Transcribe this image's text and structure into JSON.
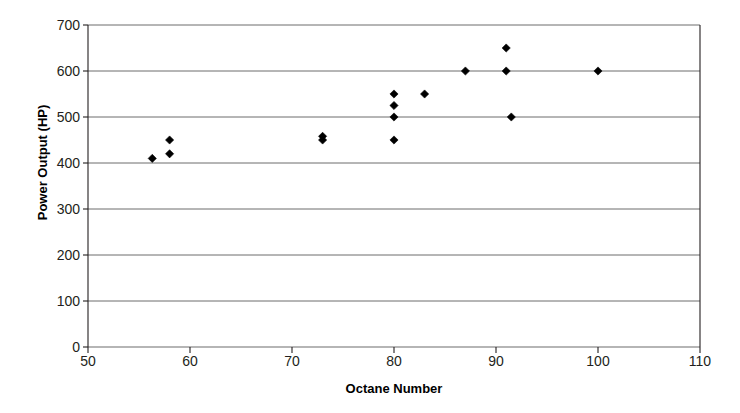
{
  "chart_data": {
    "type": "scatter",
    "title": "",
    "xlabel": "Octane Number",
    "ylabel": "Power Output (HP)",
    "xlim": [
      50,
      110
    ],
    "ylim": [
      0,
      700
    ],
    "xticks": [
      50,
      60,
      70,
      80,
      90,
      100,
      110
    ],
    "yticks": [
      0,
      100,
      200,
      300,
      400,
      500,
      600,
      700
    ],
    "xtick_labels": [
      "50",
      "60",
      "70",
      "80",
      "90",
      "100",
      "110"
    ],
    "ytick_labels": [
      "0",
      "100",
      "200",
      "300",
      "400",
      "500",
      "600",
      "700"
    ],
    "grid": "horizontal",
    "legend": "none",
    "marker": "diamond",
    "marker_color": "#000000",
    "series": [
      {
        "name": "Power Output",
        "points": [
          {
            "x": 56.3,
            "y": 410
          },
          {
            "x": 58.0,
            "y": 450
          },
          {
            "x": 58.0,
            "y": 420
          },
          {
            "x": 73.0,
            "y": 458
          },
          {
            "x": 73.0,
            "y": 450
          },
          {
            "x": 80.0,
            "y": 550
          },
          {
            "x": 80.0,
            "y": 525
          },
          {
            "x": 80.0,
            "y": 500
          },
          {
            "x": 80.0,
            "y": 450
          },
          {
            "x": 83.0,
            "y": 550
          },
          {
            "x": 87.0,
            "y": 600
          },
          {
            "x": 91.0,
            "y": 650
          },
          {
            "x": 91.0,
            "y": 600
          },
          {
            "x": 91.5,
            "y": 500
          },
          {
            "x": 100.0,
            "y": 600
          }
        ]
      }
    ]
  },
  "axes": {
    "x_title": "Octane Number",
    "y_title": "Power Output (HP)"
  },
  "colors": {
    "background": "#ffffff",
    "axis": "#231f20",
    "gridline": "#6d6d6d",
    "marker": "#000000",
    "tick_text": "#231f20"
  }
}
